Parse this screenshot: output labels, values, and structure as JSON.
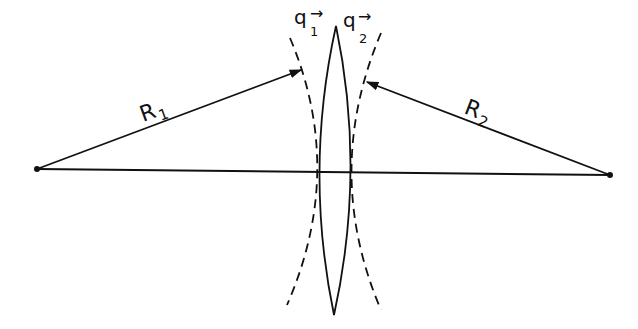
{
  "diagram": {
    "type": "thin-lens-radii-of-curvature",
    "colors": {
      "ink": "#111111",
      "background": "#ffffff"
    },
    "labels": {
      "r1": {
        "main": "R",
        "sub": "1"
      },
      "r2": {
        "main": "R",
        "sub": "2"
      },
      "q1": {
        "main": "q",
        "sub": "1",
        "arrow": "→"
      },
      "q2": {
        "main": "q",
        "sub": "2",
        "arrow": "→"
      }
    },
    "points": {
      "center_left": {
        "x": 37,
        "y": 169
      },
      "center_right": {
        "x": 610,
        "y": 175
      }
    },
    "elements": [
      "optical axis",
      "biconvex lens",
      "dashed left surface arc",
      "dashed right surface arc",
      "R1 arrow from left center of curvature to left surface",
      "R2 arrow from right center of curvature to right surface"
    ]
  }
}
